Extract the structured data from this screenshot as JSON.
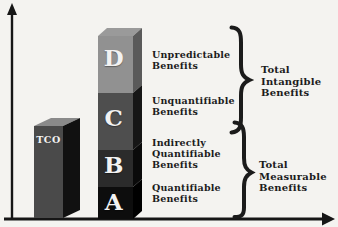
{
  "diagram": {
    "title_implicit": "TCO vs Benefits",
    "background_color": "#f4f3f0",
    "ink_color": "#1a1a1a",
    "letter_color": "#f2f2f2",
    "tco_bar": {
      "label": "TCO",
      "front_color": "#4a4a4a",
      "side_color": "#111111",
      "top_color": "#8a8a8a"
    },
    "stacked_bar": {
      "top_color": "#9a9a9a",
      "segments": [
        {
          "letter": "D",
          "benefit_label": "Unpredictable\nBenefits",
          "front_color": "#919191",
          "side_color": "#5a5a5a"
        },
        {
          "letter": "C",
          "benefit_label": "Unquantifiable\nBenefits",
          "front_color": "#4e4e4e",
          "side_color": "#161616"
        },
        {
          "letter": "B",
          "benefit_label": "Indirectly\nQuantifiable\nBenefits",
          "front_color": "#2b2b2b",
          "side_color": "#0a0a0a"
        },
        {
          "letter": "A",
          "benefit_label": "Quantifiable\nBenefits",
          "front_color": "#0d0d0d",
          "side_color": "#000000"
        }
      ]
    },
    "groups": [
      {
        "label": "Total\nIntangible\nBenefits"
      },
      {
        "label": "Total\nMeasurable\nBenefits"
      }
    ]
  }
}
